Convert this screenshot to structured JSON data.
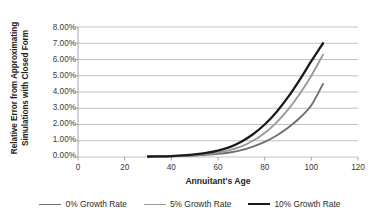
{
  "chart_data": {
    "type": "line",
    "title": "",
    "xlabel": "Annuitant's Age",
    "ylabel_lines": [
      "Relative Error from Approximating",
      "Simulations with Closed Form"
    ],
    "ylabel": "Relative Error from Approximating Simulations with Closed Form",
    "xlim": [
      0,
      120
    ],
    "ylim": [
      0,
      0.08
    ],
    "xticks": [
      0,
      20,
      40,
      60,
      80,
      100,
      120
    ],
    "xtick_labels": [
      "0",
      "20",
      "40",
      "60",
      "80",
      "100",
      "120"
    ],
    "yticks": [
      0,
      0.01,
      0.02,
      0.03,
      0.04,
      0.05,
      0.06,
      0.07,
      0.08
    ],
    "ytick_labels": [
      "0.00%",
      "1.00%",
      "2.00%",
      "3.00%",
      "4.00%",
      "5.00%",
      "6.00%",
      "7.00%",
      "8.00%"
    ],
    "grid": "horizontal",
    "legend_position": "bottom",
    "x": [
      30,
      35,
      40,
      45,
      50,
      55,
      60,
      65,
      70,
      75,
      80,
      85,
      90,
      95,
      100,
      105
    ],
    "series": [
      {
        "name": "0% Growth Rate",
        "color": "#6f6f6f",
        "width": 1.9,
        "values": [
          0.0002,
          0.0003,
          0.0004,
          0.0006,
          0.0009,
          0.0013,
          0.0019,
          0.0028,
          0.0042,
          0.0064,
          0.0093,
          0.0131,
          0.018,
          0.024,
          0.0318,
          0.045
        ]
      },
      {
        "name": "5% Growth Rate",
        "color": "#9a9a9a",
        "width": 1.9,
        "values": [
          0.0002,
          0.0003,
          0.0005,
          0.0008,
          0.0012,
          0.0018,
          0.0027,
          0.0042,
          0.0065,
          0.01,
          0.0148,
          0.0212,
          0.0292,
          0.0388,
          0.05,
          0.063
        ]
      },
      {
        "name": "10% Growth Rate",
        "color": "#1a1a1a",
        "width": 2.3,
        "values": [
          0.0003,
          0.0004,
          0.0006,
          0.001,
          0.0016,
          0.0025,
          0.0039,
          0.0061,
          0.0094,
          0.014,
          0.02,
          0.0276,
          0.0368,
          0.0475,
          0.059,
          0.07
        ]
      }
    ]
  },
  "legend": {
    "items": [
      {
        "label": "0% Growth Rate",
        "color": "#6f6f6f",
        "width": "1.9px"
      },
      {
        "label": "5% Growth Rate",
        "color": "#9a9a9a",
        "width": "1.9px"
      },
      {
        "label": "10% Growth Rate",
        "color": "#1a1a1a",
        "width": "2.4px"
      }
    ]
  },
  "axes": {
    "gridline_color": "#b3b3b3",
    "axis_color": "#9a9a9a"
  }
}
